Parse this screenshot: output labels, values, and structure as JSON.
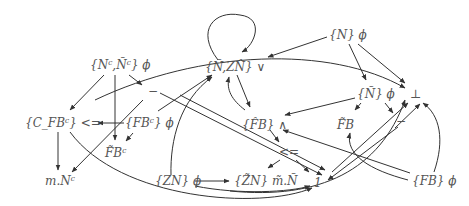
{
  "diagram": {
    "type": "directed-graph",
    "nodes": [
      {
        "id": "n1",
        "label": "{Ñ,ΖN̂} ∨",
        "display": "{Ñ,ZN̂} ∨"
      },
      {
        "id": "n2",
        "label": "{N} ϕ"
      },
      {
        "id": "n3",
        "label": "{Nᶜ,Ñᶜ} ϕ"
      },
      {
        "id": "n4",
        "label": "−"
      },
      {
        "id": "n5",
        "label": "{Ñ} ϕ"
      },
      {
        "id": "n6",
        "label": "⊥"
      },
      {
        "id": "n7",
        "label": "{C_FBᶜ} <="
      },
      {
        "id": "n8",
        "label": "{FBᶜ} ϕ"
      },
      {
        "id": "n9",
        "label": "{F̂B} ∧"
      },
      {
        "id": "n10",
        "label": "F̃B"
      },
      {
        "id": "n11",
        "label": "−"
      },
      {
        "id": "n12",
        "label": "F̃Bᶜ"
      },
      {
        "id": "n13",
        "label": "<="
      },
      {
        "id": "n14",
        "label": "m.Nᶜ"
      },
      {
        "id": "n15",
        "label": "{ZN} ϕ"
      },
      {
        "id": "n16",
        "label": "{Z̃N} m̃.Ñ"
      },
      {
        "id": "n17",
        "label": "1"
      },
      {
        "id": "n18",
        "label": "{FB} ϕ"
      }
    ],
    "labels": {
      "n1": "{Ñ,ZN̂} ∨",
      "n2": "{N} ϕ",
      "n3": "{Nᶜ,Ñᶜ} ϕ",
      "n4": "−",
      "n5": "{Ñ} ϕ",
      "n6": "⊥",
      "n7": "{C_FBᶜ} <=",
      "n8": "{FBᶜ} ϕ",
      "n9": "{F̂B} ∧",
      "n10": "F̃B",
      "n11": "−",
      "n12": "F̃Bᶜ",
      "n13": "<=",
      "n14": "m.Nᶜ",
      "n15": "{ZN} ϕ",
      "n16": "{Z̃N} m̃.Ñ",
      "n17": "1",
      "n18": "{FB} ϕ"
    },
    "edges": [
      [
        "n1",
        "n1"
      ],
      [
        "n2",
        "n1"
      ],
      [
        "n2",
        "n5"
      ],
      [
        "n2",
        "n6"
      ],
      [
        "n3",
        "n7"
      ],
      [
        "n3",
        "n12"
      ],
      [
        "n3",
        "n4"
      ],
      [
        "n4",
        "n17"
      ],
      [
        "n4",
        "n14"
      ],
      [
        "n5",
        "n10"
      ],
      [
        "n5",
        "n11"
      ],
      [
        "n5",
        "n1"
      ],
      [
        "n8",
        "n7"
      ],
      [
        "n8",
        "n12"
      ],
      [
        "n8",
        "n1"
      ],
      [
        "n1",
        "n9"
      ],
      [
        "n15",
        "n9"
      ],
      [
        "n9",
        "n13"
      ],
      [
        "n13",
        "n16"
      ],
      [
        "n13",
        "n17"
      ],
      [
        "n7",
        "n14"
      ],
      [
        "n7",
        "n17"
      ],
      [
        "n15",
        "n16"
      ],
      [
        "n15",
        "n17"
      ],
      [
        "n15",
        "n6"
      ],
      [
        "n18",
        "n6"
      ],
      [
        "n18",
        "n10"
      ],
      [
        "n18",
        "n9"
      ],
      [
        "n11",
        "n17"
      ],
      [
        "n11",
        "n6"
      ]
    ],
    "colors": {
      "stroke": "#333333",
      "text": "#555555"
    }
  }
}
